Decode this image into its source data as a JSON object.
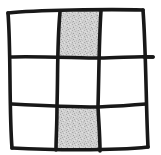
{
  "figure": {
    "kind": "hand-drawn-grid-puzzle",
    "title": "Hand-drawn 3 by 3 grid with two shaded cells",
    "background_color": "#ffffff",
    "stroke_color": "#181818",
    "stroke_width_px": 3.6,
    "shaded_fill_color": "#cfcfcf",
    "shaded_fill_speckle_color": "#a8a8a8",
    "unshaded_fill_color": "#ffffff",
    "rows": 3,
    "columns": 3,
    "shaded_cell_count": 2,
    "unshaded_cell_count": 7
  },
  "grid": {
    "outline_name": "grid-outline",
    "corners": {
      "top_left": {
        "x": 8,
        "y": 13
      },
      "top_right": {
        "x": 143,
        "y": 10
      },
      "bottom_right": {
        "x": 148,
        "y": 147
      },
      "bottom_left": {
        "x": 12,
        "y": 148
      }
    },
    "overshoot_nub": {
      "name": "right-edge-overshoot-nub",
      "x1": 144,
      "y1": 57,
      "x2": 153,
      "y2": 57
    },
    "cells": [
      {
        "id": "r1c1",
        "row": 1,
        "column": 1,
        "label": "top-left",
        "shaded": false,
        "fill": "#ffffff",
        "points": "8,13 60,12 58,58 10,57"
      },
      {
        "id": "r1c2",
        "row": 1,
        "column": 2,
        "label": "top-middle",
        "shaded": true,
        "fill": "#cfcfcf",
        "points": "60,12 101,11 99,58 58,58"
      },
      {
        "id": "r1c3",
        "row": 1,
        "column": 3,
        "label": "top-right",
        "shaded": false,
        "fill": "#ffffff",
        "points": "101,11 143,10 144,57 99,58"
      },
      {
        "id": "r2c1",
        "row": 2,
        "column": 1,
        "label": "middle-left",
        "shaded": false,
        "fill": "#ffffff",
        "points": "10,57 58,58 57,106 12,104"
      },
      {
        "id": "r2c2",
        "row": 2,
        "column": 2,
        "label": "center",
        "shaded": false,
        "fill": "#ffffff",
        "points": "58,58 99,58 98,107 57,106"
      },
      {
        "id": "r2c3",
        "row": 2,
        "column": 3,
        "label": "middle-right",
        "shaded": false,
        "fill": "#ffffff",
        "points": "99,58 144,57 146,104 98,107"
      },
      {
        "id": "r3c1",
        "row": 3,
        "column": 1,
        "label": "bottom-left",
        "shaded": false,
        "fill": "#ffffff",
        "points": "12,104 57,106 56,149 12,148"
      },
      {
        "id": "r3c2",
        "row": 3,
        "column": 2,
        "label": "bottom-middle",
        "shaded": true,
        "fill": "#cfcfcf",
        "points": "57,106 98,107 100,150 56,149"
      },
      {
        "id": "r3c3",
        "row": 3,
        "column": 3,
        "label": "bottom-right",
        "shaded": false,
        "fill": "#ffffff",
        "points": "98,107 146,104 148,147 100,150"
      }
    ],
    "lines": [
      {
        "id": "outer-top",
        "name": "outer-edge-top",
        "d": "M 8,13 C 34,10 110,9 143,10"
      },
      {
        "id": "outer-right",
        "name": "outer-edge-right",
        "d": "M 143,10 C 146,50 146,106 148,147"
      },
      {
        "id": "outer-bottom",
        "name": "outer-edge-bottom",
        "d": "M 148,147 C 112,151 48,150 12,148"
      },
      {
        "id": "outer-left",
        "name": "outer-edge-left",
        "d": "M 12,148 C 9,110 11,50 8,13"
      },
      {
        "id": "vertical-1",
        "name": "inner-vertical-left",
        "d": "M 60,12 C 57,44 58,74 57,106 C 57,126 56,138 56,150"
      },
      {
        "id": "vertical-2",
        "name": "inner-vertical-right",
        "d": "M 101,11 C 99,40 99,72 98,107 C 99,126 100,138 100,151"
      },
      {
        "id": "horizontal-1",
        "name": "inner-horizontal-top",
        "d": "M 10,57 C 34,56 80,58 99,58 C 120,58 136,56 153,57"
      },
      {
        "id": "horizontal-2",
        "name": "inner-horizontal-bottom",
        "d": "M 12,104 C 30,105 78,107 98,107 C 120,106 134,105 146,104"
      }
    ]
  }
}
